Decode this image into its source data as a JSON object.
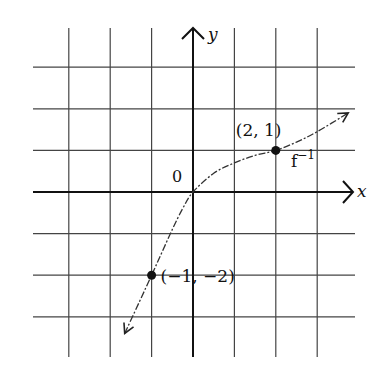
{
  "chart_data": {
    "type": "line",
    "title": "",
    "xlabel": "x",
    "ylabel": "y",
    "origin_label": "0",
    "xlim": [
      -3.8,
      3.9
    ],
    "ylim": [
      -4,
      4
    ],
    "grid": true,
    "grid_step": 1,
    "series": [
      {
        "name": "f⁻¹",
        "label": "f",
        "label_superscript": "−1",
        "style": "dash-dot",
        "arrows": "both",
        "x": [
          -1.65,
          -1.3,
          -1,
          -0.75,
          -0.5,
          -0.25,
          0,
          0.5,
          1,
          1.5,
          2,
          2.5,
          3,
          3.75
        ],
        "y": [
          -3.4,
          -2.65,
          -2,
          -1.45,
          -0.9,
          -0.4,
          0,
          0.45,
          0.7,
          0.88,
          1,
          1.2,
          1.45,
          1.9
        ]
      }
    ],
    "points": [
      {
        "x": 2,
        "y": 1,
        "label": "(2, 1)"
      },
      {
        "x": -1,
        "y": -2,
        "label": "(−1, −2)"
      }
    ]
  }
}
